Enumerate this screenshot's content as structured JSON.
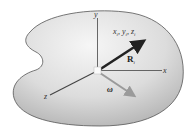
{
  "diagram": {
    "type": "rigid-body-coordinate-system",
    "body": {
      "fill_center": "#f4f4f4",
      "fill_edge": "#b8b8b8",
      "outline": "#555555"
    },
    "axes": {
      "x_label": "x",
      "y_label": "y",
      "z_label": "z"
    },
    "point_label": {
      "x": "x",
      "y": "y",
      "z": "z",
      "sub": "i"
    },
    "position_vector": {
      "label": "R",
      "sub": "i",
      "color": "#222222"
    },
    "angular_velocity": {
      "label": "ω",
      "color": "#9a9a9a"
    }
  }
}
